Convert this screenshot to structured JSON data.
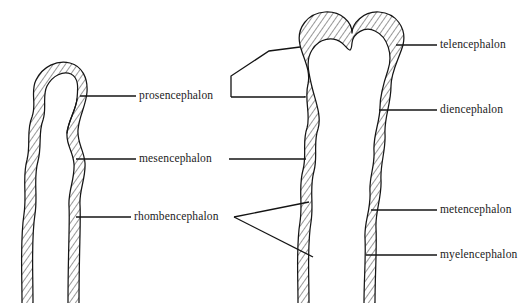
{
  "figure": {
    "type": "anatomical-line-diagram",
    "background_color": "#ffffff",
    "ink_color": "#151515",
    "panels": [
      {
        "name": "three-vesicle-stage",
        "position": "left",
        "description": "Early neural tube with three primary brain vesicles, wall shown in cross-hatched section"
      },
      {
        "name": "five-vesicle-stage",
        "position": "right",
        "description": "Later neural tube with five secondary brain vesicles, bilobed telencephalon at top"
      }
    ]
  },
  "labels": {
    "left_panel": [
      {
        "id": "prosencephalon",
        "text": "prosencephalon",
        "leader": "straight"
      },
      {
        "id": "mesencephalon",
        "text": "mesencephalon",
        "leader": "straight"
      },
      {
        "id": "rhombencephalon",
        "text": "rhombencephalon",
        "leader": "straight"
      }
    ],
    "middle_leaders": [
      {
        "id": "prosencephalon-bracket",
        "target": "prosencephalon",
        "leader": "bracket-wedge"
      },
      {
        "id": "mesencephalon-line",
        "target": "mesencephalon",
        "leader": "straight"
      },
      {
        "id": "rhombencephalon-fork",
        "target": "rhombencephalon",
        "leader": "v-fork"
      }
    ],
    "right_panel": [
      {
        "id": "telencephalon",
        "text": "telencephalon",
        "leader": "straight"
      },
      {
        "id": "diencephalon",
        "text": "diencephalon",
        "leader": "straight"
      },
      {
        "id": "metencephalon",
        "text": "metencephalon",
        "leader": "straight"
      },
      {
        "id": "myelencephalon",
        "text": "myelencephalon",
        "leader": "straight"
      }
    ]
  }
}
